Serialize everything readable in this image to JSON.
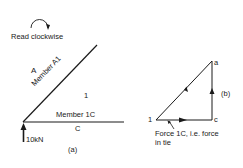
{
  "read_direction": "Read clockwise",
  "space_diagram": {
    "caption": "(a)",
    "space_A": "A",
    "space_1": "1",
    "space_C": "C",
    "member_A1": "Member A1",
    "member_1C": "Member 1C",
    "reaction": "10kN"
  },
  "force_diagram": {
    "caption": "(b)",
    "point_a": "a",
    "point_1": "1",
    "point_c": "c",
    "annotation_line1": "Force 1C, i.e. force",
    "annotation_line2": "in tie"
  }
}
